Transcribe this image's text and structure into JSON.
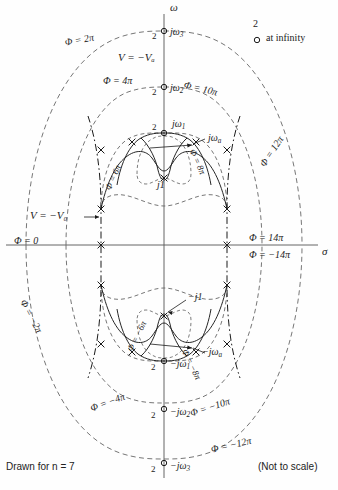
{
  "figure": {
    "type": "complex-plane-field-map",
    "caption_left": "Drawn for n = 7",
    "caption_right": "(Not to scale)",
    "axis_imag": "ω",
    "axis_real": "σ",
    "legend": {
      "count": "2",
      "text": "at infinity",
      "marker": "zero-circle"
    },
    "potential_inner": "V = −Vₐ",
    "potential_outer": "V = −V₀",
    "colors": {
      "ink": "#1a1a1a",
      "dash": "#555555",
      "axis": "#444444"
    }
  },
  "axis_points": {
    "jw3": {
      "label": "jω",
      "sub": "3",
      "mult": "2"
    },
    "jw2": {
      "label": "jω",
      "sub": "2",
      "mult": "2"
    },
    "jw1": {
      "label": "jω",
      "sub": "1",
      "mult": "2"
    },
    "jwa": {
      "label": "jω",
      "sub": "a"
    },
    "j1": {
      "label": "j1"
    },
    "mj1": {
      "label": "−j1"
    },
    "mjwa": {
      "label": "−jω",
      "sub": "a"
    },
    "mjw1": {
      "label": "−jω",
      "sub": "1",
      "mult": "2"
    },
    "mjw2": {
      "label": "−jω",
      "sub": "2",
      "mult": "2"
    },
    "mjw3": {
      "label": "−jω",
      "sub": "3",
      "mult": "2"
    }
  },
  "phi_labels": {
    "p0": "Φ = 0",
    "p2pi": "Φ = 2π",
    "p4pi": "Φ = 4π",
    "p6pi": "Φ = 6π",
    "p8pi": "Φ = 8π",
    "p10pi": "Φ = 10π",
    "p12pi": "Φ = 12π",
    "p14pi": "Φ = 14π",
    "m14pi": "Φ = −14π",
    "m2pi": "Φ = −2π",
    "m4pi": "Φ = −4π",
    "m6pi": "Φ = −6π",
    "m8pi": "Φ = −8π",
    "m10pi": "Φ = −10π",
    "m12pi": "Φ = −12π"
  }
}
